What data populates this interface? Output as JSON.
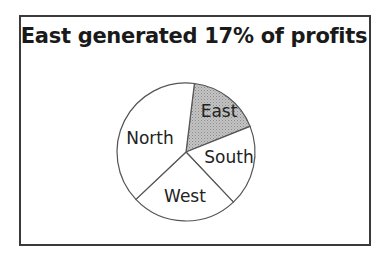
{
  "title": "East generated 17% of profits",
  "chart_data": {
    "type": "pie",
    "title": "East generated 17% of profits",
    "categories": [
      "East",
      "South",
      "West",
      "North"
    ],
    "values": [
      17,
      19,
      25,
      39
    ],
    "start_angle_deg": 7,
    "direction": "clockwise",
    "highlight": "East",
    "colors": {
      "East": "#b8b8b8",
      "South": "#ffffff",
      "West": "#ffffff",
      "North": "#ffffff"
    },
    "legend": "none",
    "labels_inside": true
  },
  "labels": {
    "east": "East",
    "south": "South",
    "west": "West",
    "north": "North"
  },
  "colors": {
    "highlight": "#b8b8b8",
    "stroke": "#555555",
    "frame": "#3a3a3a"
  }
}
